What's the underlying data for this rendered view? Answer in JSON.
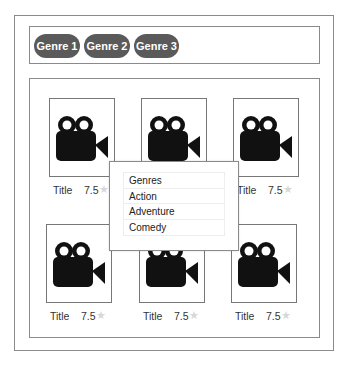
{
  "genre_bar": {
    "pills": [
      {
        "label": "Genre 1"
      },
      {
        "label": "Genre 2"
      },
      {
        "label": "Genre 3"
      }
    ]
  },
  "movies": [
    {
      "title": "Title",
      "rating": "7.5",
      "icon": "movie-camera-icon",
      "star": "★"
    },
    {
      "title": "Title",
      "rating": "7.5",
      "icon": "movie-camera-icon",
      "star": "★"
    },
    {
      "title": "Title",
      "rating": "7.5",
      "icon": "movie-camera-icon",
      "star": "★"
    },
    {
      "title": "Title",
      "rating": "7.5",
      "icon": "movie-camera-icon",
      "star": "★"
    },
    {
      "title": "Title",
      "rating": "7.5",
      "icon": "movie-camera-icon",
      "star": "★"
    },
    {
      "title": "Title",
      "rating": "7.5",
      "icon": "movie-camera-icon",
      "star": "★"
    }
  ],
  "genre_popup": {
    "items": [
      {
        "label": "Genres"
      },
      {
        "label": "Action"
      },
      {
        "label": "Adventure"
      },
      {
        "label": "Comedy"
      }
    ]
  },
  "colors": {
    "pill_bg": "#5a5a5a",
    "border": "#8a8a8a",
    "star": "#d8d8d8"
  }
}
